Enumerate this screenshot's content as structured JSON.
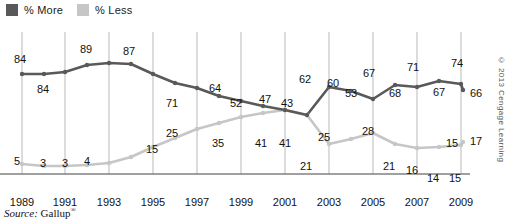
{
  "legend": {
    "items": [
      {
        "label": "% More",
        "color": "#595959",
        "icon": "legend-swatch-more"
      },
      {
        "label": "% Less",
        "color": "#c6c6c6",
        "icon": "legend-swatch-less"
      }
    ]
  },
  "source": {
    "prefix": "Source:",
    "name": "Gallup",
    "mark": "®"
  },
  "copyright": "© 2013 Cengage Learning",
  "chart_data": {
    "type": "line",
    "title": "",
    "subtitle": "",
    "xlabel": "",
    "ylabel": "",
    "grid": "vertical-at-odd-years",
    "legend_position": "top-left",
    "ylim": [
      0,
      100
    ],
    "xlim": [
      1989,
      2010
    ],
    "x": [
      1989,
      1990,
      1991,
      1992,
      1993,
      1994,
      1995,
      1996,
      1997,
      1998,
      1999,
      2000,
      2001,
      2002,
      2003,
      2004,
      2005,
      2006,
      2007,
      2008,
      2009,
      2010
    ],
    "tick_labels": [
      "1989",
      "1991",
      "1993",
      "1995",
      "1997",
      "1999",
      "2001",
      "2003",
      "2005",
      "2007",
      "2009"
    ],
    "tick_values": [
      1989,
      1991,
      1993,
      1995,
      1997,
      1999,
      2001,
      2003,
      2005,
      2007,
      2009
    ],
    "series": [
      {
        "name": "% More",
        "color": "#595959",
        "values": [
          84,
          84,
          84,
          87,
          89,
          89,
          87,
          80,
          71,
          67,
          64,
          58,
          52,
          49,
          47,
          43,
          62,
          60,
          53,
          67,
          68,
          71
        ],
        "labeled_points": [
          {
            "x": 1989,
            "value": 84,
            "label": "84"
          },
          {
            "x": 1991,
            "value": 84,
            "label": "84"
          },
          {
            "x": 1993,
            "value": 89,
            "label": "89"
          },
          {
            "x": 1995,
            "value": 87,
            "label": "87"
          },
          {
            "x": 1997,
            "value": 71,
            "label": "71"
          },
          {
            "x": 1999,
            "value": 64,
            "label": "64"
          },
          {
            "x": 2001,
            "value": 52,
            "label": "52"
          },
          {
            "x": 2003,
            "value": 47,
            "label": "47"
          },
          {
            "x": 2004,
            "value": 43,
            "label": "43"
          },
          {
            "x": 2005,
            "value": 62,
            "label": "62"
          },
          {
            "x": 2006,
            "value": 60,
            "label": "60"
          },
          {
            "x": 2007,
            "value": 53,
            "label": "53"
          },
          {
            "x": 2008,
            "value": 67,
            "label": "67"
          },
          {
            "x": 2009,
            "value": 68,
            "label": "68"
          },
          {
            "x": 2010,
            "value": 71,
            "label": "71"
          },
          {
            "x": 2011,
            "value": 67,
            "label": "67"
          },
          {
            "x": 2012,
            "value": 74,
            "label": "74"
          },
          {
            "x": 2013,
            "value": 66,
            "label": "66"
          }
        ]
      },
      {
        "name": "% Less",
        "color": "#c6c6c6",
        "values": [
          5,
          4,
          3,
          3,
          3,
          4,
          4,
          9,
          15,
          20,
          25,
          30,
          35,
          38,
          41,
          41,
          21,
          25,
          28,
          21,
          16,
          14
        ],
        "labeled_points": [
          {
            "x": 1989,
            "value": 5,
            "label": "5"
          },
          {
            "x": 1991,
            "value": 3,
            "label": "3"
          },
          {
            "x": 1993,
            "value": 3,
            "label": "3"
          },
          {
            "x": 1995,
            "value": 4,
            "label": "4"
          },
          {
            "x": 1997,
            "value": 15,
            "label": "15"
          },
          {
            "x": 1999,
            "value": 25,
            "label": "25"
          },
          {
            "x": 2001,
            "value": 35,
            "label": "35"
          },
          {
            "x": 2003,
            "value": 41,
            "label": "41"
          },
          {
            "x": 2004,
            "value": 41,
            "label": "41"
          },
          {
            "x": 2005,
            "value": 21,
            "label": "21"
          },
          {
            "x": 2006,
            "value": 25,
            "label": "25"
          },
          {
            "x": 2007,
            "value": 28,
            "label": "28"
          },
          {
            "x": 2008,
            "value": 21,
            "label": "21"
          },
          {
            "x": 2009,
            "value": 16,
            "label": "16"
          },
          {
            "x": 2010,
            "value": 14,
            "label": "14"
          },
          {
            "x": 2011,
            "value": 15,
            "label": "15"
          },
          {
            "x": 2012,
            "value": 15,
            "label": "15"
          },
          {
            "x": 2013,
            "value": 17,
            "label": "17"
          }
        ]
      }
    ]
  },
  "geometry": {
    "more_points": [
      [
        22,
        48
      ],
      [
        44,
        48
      ],
      [
        65,
        46
      ],
      [
        87,
        39
      ],
      [
        109,
        37
      ],
      [
        131,
        38
      ],
      [
        153,
        48
      ],
      [
        175,
        57
      ],
      [
        197,
        62
      ],
      [
        219,
        70
      ],
      [
        241,
        75
      ],
      [
        263,
        80
      ],
      [
        285,
        84
      ],
      [
        307,
        89
      ],
      [
        329,
        61
      ],
      [
        351,
        65
      ],
      [
        373,
        73
      ],
      [
        395,
        59
      ],
      [
        417,
        61
      ],
      [
        439,
        55
      ],
      [
        461,
        58
      ],
      [
        463,
        64
      ]
    ],
    "less_points": [
      [
        22,
        138
      ],
      [
        44,
        140
      ],
      [
        65,
        140
      ],
      [
        87,
        139
      ],
      [
        109,
        137
      ],
      [
        131,
        131
      ],
      [
        153,
        121
      ],
      [
        175,
        112
      ],
      [
        197,
        103
      ],
      [
        219,
        97
      ],
      [
        241,
        91
      ],
      [
        263,
        87
      ],
      [
        285,
        84
      ],
      [
        307,
        89
      ],
      [
        329,
        118
      ],
      [
        351,
        113
      ],
      [
        373,
        107
      ],
      [
        395,
        118
      ],
      [
        417,
        122
      ],
      [
        439,
        121
      ],
      [
        461,
        119
      ],
      [
        463,
        116
      ]
    ]
  },
  "value_labels": {
    "more": [
      {
        "text": "84",
        "x": 14,
        "y": 28
      },
      {
        "text": "84",
        "x": 37,
        "y": 58
      },
      {
        "text": "89",
        "x": 80,
        "y": 18
      },
      {
        "text": "87",
        "x": 123,
        "y": 20
      },
      {
        "text": "71",
        "x": 166,
        "y": 72
      },
      {
        "text": "64",
        "x": 209,
        "y": 57
      },
      {
        "text": "52",
        "x": 230,
        "y": 72
      },
      {
        "text": "47",
        "x": 259,
        "y": 68
      },
      {
        "text": "43",
        "x": 281,
        "y": 72
      },
      {
        "text": "62",
        "x": 299,
        "y": 48
      },
      {
        "text": "60",
        "x": 327,
        "y": 52
      },
      {
        "text": "53",
        "x": 345,
        "y": 62
      },
      {
        "text": "67",
        "x": 363,
        "y": 42
      },
      {
        "text": "68",
        "x": 389,
        "y": 62
      },
      {
        "text": "71",
        "x": 407,
        "y": 36
      },
      {
        "text": "67",
        "x": 433,
        "y": 61
      },
      {
        "text": "74",
        "x": 451,
        "y": 32
      },
      {
        "text": "66",
        "x": 470,
        "y": 62
      }
    ],
    "less": [
      {
        "text": "5",
        "x": 14,
        "y": 130
      },
      {
        "text": "3",
        "x": 40,
        "y": 132
      },
      {
        "text": "3",
        "x": 62,
        "y": 132
      },
      {
        "text": "4",
        "x": 84,
        "y": 130
      },
      {
        "text": "15",
        "x": 146,
        "y": 118
      },
      {
        "text": "25",
        "x": 166,
        "y": 102
      },
      {
        "text": "35",
        "x": 212,
        "y": 112
      },
      {
        "text": "41",
        "x": 255,
        "y": 112
      },
      {
        "text": "41",
        "x": 279,
        "y": 112
      },
      {
        "text": "21",
        "x": 300,
        "y": 135
      },
      {
        "text": "25",
        "x": 318,
        "y": 106
      },
      {
        "text": "28",
        "x": 362,
        "y": 100
      },
      {
        "text": "21",
        "x": 383,
        "y": 135
      },
      {
        "text": "16",
        "x": 406,
        "y": 139
      },
      {
        "text": "14",
        "x": 427,
        "y": 147
      },
      {
        "text": "15",
        "x": 446,
        "y": 112
      },
      {
        "text": "15",
        "x": 449,
        "y": 147
      },
      {
        "text": "17",
        "x": 470,
        "y": 110
      }
    ]
  },
  "xaxis": {
    "ticks": [
      {
        "label": "1989",
        "x": 22
      },
      {
        "label": "1991",
        "x": 65
      },
      {
        "label": "1993",
        "x": 109
      },
      {
        "label": "1995",
        "x": 153
      },
      {
        "label": "1997",
        "x": 197
      },
      {
        "label": "1999",
        "x": 241
      },
      {
        "label": "2001",
        "x": 285
      },
      {
        "label": "2003",
        "x": 329
      },
      {
        "label": "2005",
        "x": 373
      },
      {
        "label": "2007",
        "x": 417
      },
      {
        "label": "2009",
        "x": 461
      }
    ]
  },
  "gridlines": [
    22,
    65,
    109,
    153,
    197,
    241,
    285,
    329,
    373,
    417,
    461
  ]
}
